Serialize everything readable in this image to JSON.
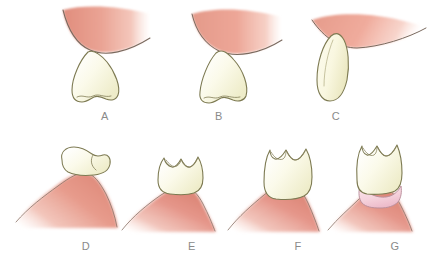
{
  "figure": {
    "background_color": "#ffffff",
    "width": 447,
    "height": 263
  },
  "colors": {
    "gum_light": "#f2b9ab",
    "gum_mid": "#e59b8c",
    "gum_deep": "#d98878",
    "gum_outline": "#7a6a5f",
    "tooth_fill": "#fbfae6",
    "tooth_fill_shade": "#f2f0d6",
    "tooth_outline": "#7d7a52",
    "cuff_fill": "#f7d9e0",
    "cuff_outline": "#b98f9c",
    "label_color": "#8a8a8a"
  },
  "panels": [
    {
      "id": "a",
      "label": "A",
      "label_x": 95,
      "label_y": 110,
      "tooth_type": "incisor-crown",
      "description": "Incisor crown fully submerged below a broad gingival wedge"
    },
    {
      "id": "b",
      "label": "B",
      "label_x": 209,
      "label_y": 110,
      "tooth_type": "incisor-crown",
      "description": "Incisor crown contacting the gingival wedge"
    },
    {
      "id": "c",
      "label": "C",
      "label_x": 326,
      "label_y": 110,
      "tooth_type": "incisor-crown-elongated",
      "description": "Elongated incisor crown emerging at the gingival margin"
    },
    {
      "id": "d",
      "label": "D",
      "label_x": 76,
      "label_y": 240,
      "tooth_type": "molar-crown-partial",
      "description": "Kidney shaped molar crown above a gingival mound"
    },
    {
      "id": "e",
      "label": "E",
      "label_x": 182,
      "label_y": 240,
      "tooth_type": "molar-crown",
      "description": "Molar crown resting on the gingival mound"
    },
    {
      "id": "f",
      "label": "F",
      "label_x": 288,
      "label_y": 240,
      "tooth_type": "molar-crown-erupting",
      "description": "Molar crown erupting through the gingiva"
    },
    {
      "id": "g",
      "label": "G",
      "label_x": 385,
      "label_y": 240,
      "tooth_type": "molar-crown-with-cuff",
      "description": "Molar crown with light pink gingival cuff at its base"
    }
  ]
}
